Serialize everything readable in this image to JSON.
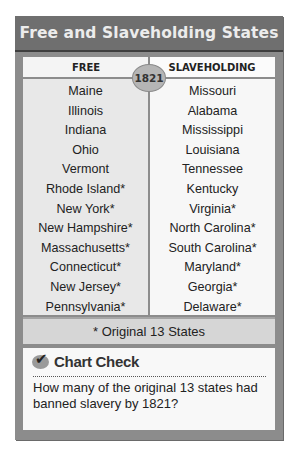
{
  "title": "Free and Slaveholding States",
  "year_badge": "1821",
  "columns": {
    "free": {
      "header": "FREE",
      "states": [
        "Maine",
        "Illinois",
        "Indiana",
        "Ohio",
        "Vermont",
        "Rhode Island*",
        "New York*",
        "New Hampshire*",
        "Massachusetts*",
        "Connecticut*",
        "New Jersey*",
        "Pennsylvania*"
      ]
    },
    "slaveholding": {
      "header": "SLAVEHOLDING",
      "states": [
        "Missouri",
        "Alabama",
        "Mississippi",
        "Louisiana",
        "Tennessee",
        "Kentucky",
        "Virginia*",
        "North Carolina*",
        "South Carolina*",
        "Maryland*",
        "Georgia*",
        "Delaware*"
      ]
    }
  },
  "footnote": "* Original 13 States",
  "chart_check": {
    "icon": "checkmark-icon",
    "title": "Chart Check",
    "question": "How many of the original 13 states had banned slavery by 1821?"
  },
  "colors": {
    "header_bg": "#6f6f6f",
    "frame": "#8c8c8c",
    "free_col_bg": "#e8e8e8",
    "slave_col_bg": "#f7f7f7",
    "footnote_bg": "#d6d6d6"
  }
}
